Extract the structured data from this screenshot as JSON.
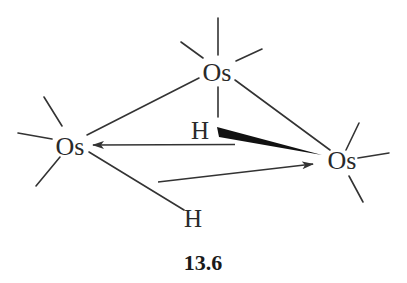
{
  "figure": {
    "label": "13.6",
    "atoms": {
      "os_top": {
        "symbol": "Os",
        "x": 217,
        "y": 72
      },
      "os_left": {
        "symbol": "Os",
        "x": 70,
        "y": 146
      },
      "os_right": {
        "symbol": "Os",
        "x": 342,
        "y": 160
      },
      "h_bridge_upper": {
        "symbol": "H",
        "x": 200,
        "y": 130
      },
      "h_bridge_lower": {
        "symbol": "H",
        "x": 193,
        "y": 218
      }
    },
    "bonds": [
      {
        "from": "os_top",
        "to": "os_left",
        "type": "single"
      },
      {
        "from": "os_top",
        "to": "os_right",
        "type": "single"
      },
      {
        "from": "os_top",
        "to": "h_bridge_upper",
        "type": "single"
      },
      {
        "from": "h_bridge_upper",
        "to": "os_right",
        "type": "wedge"
      },
      {
        "from": "os_left",
        "to": "h_bridge_lower",
        "type": "single"
      }
    ],
    "arrows": [
      {
        "from": "h_bridge_upper",
        "to": "os_left",
        "type": "dative"
      },
      {
        "from": "h_bridge_lower",
        "to": "os_right",
        "type": "dative"
      }
    ],
    "ligand_stubs": {
      "os_top": 5,
      "os_left": 3,
      "os_right": 3
    },
    "colors": {
      "ink": "#333333",
      "background": "#ffffff"
    }
  }
}
